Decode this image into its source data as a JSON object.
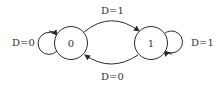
{
  "diagram": {
    "type": "state-machine",
    "states": [
      {
        "id": "s0",
        "label": "0"
      },
      {
        "id": "s1",
        "label": "1"
      }
    ],
    "transitions": [
      {
        "from": "s0",
        "to": "s0",
        "label": "D=0"
      },
      {
        "from": "s0",
        "to": "s1",
        "label": "D=1"
      },
      {
        "from": "s1",
        "to": "s0",
        "label": "D=0"
      },
      {
        "from": "s1",
        "to": "s1",
        "label": "D=1"
      }
    ],
    "colors": {
      "stroke": "#2b2b2b",
      "text": "#333333",
      "background": "#ffffff"
    }
  }
}
